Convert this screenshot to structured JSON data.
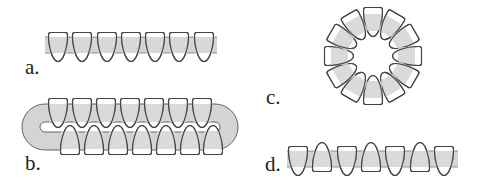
{
  "diagram": {
    "colors": {
      "band": "#d4d4d4",
      "tooth_fill": "#ffffff",
      "tooth_shade": "#d4d4d4",
      "outline": "#444444",
      "label": "#222222"
    },
    "panels": [
      {
        "id": "a",
        "label": "a.",
        "arrangement": "linear",
        "tooth_count": 7,
        "orientation": "all-down"
      },
      {
        "id": "b",
        "label": "b.",
        "arrangement": "loop",
        "tooth_count": 14,
        "orientation": "two staggered rows"
      },
      {
        "id": "c",
        "label": "c.",
        "arrangement": "ring",
        "tooth_count": 12,
        "orientation": "radial-inward"
      },
      {
        "id": "d",
        "label": "d.",
        "arrangement": "linear",
        "tooth_count": 7,
        "orientation": "alternating down/up"
      }
    ]
  }
}
